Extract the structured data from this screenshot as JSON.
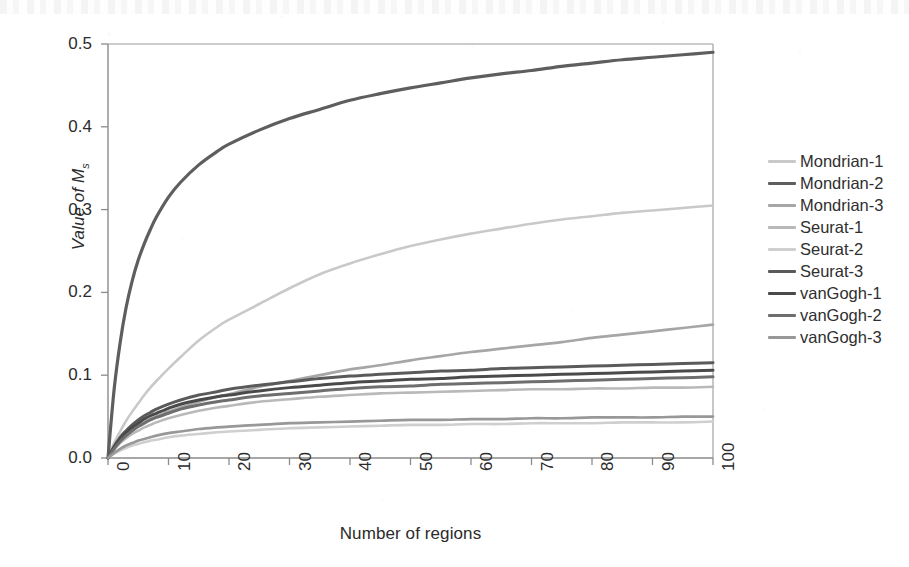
{
  "chart_data": {
    "type": "line",
    "title": "",
    "xlabel": "Number of regions",
    "ylabel": "Value of Ms",
    "ylabel_base": "Value of M",
    "ylabel_sub": "s",
    "xlim": [
      0,
      100
    ],
    "ylim": [
      0.0,
      0.5
    ],
    "grid": false,
    "legend_position": "right",
    "x_ticks": [
      "0",
      "10",
      "20",
      "30",
      "40",
      "50",
      "60",
      "70",
      "80",
      "90",
      "100"
    ],
    "x_tick_values": [
      0,
      10,
      20,
      30,
      40,
      50,
      60,
      70,
      80,
      90,
      100
    ],
    "y_ticks": [
      "0.0",
      "0.1",
      "0.2",
      "0.3",
      "0.4",
      "0.5"
    ],
    "y_tick_values": [
      0.0,
      0.1,
      0.2,
      0.3,
      0.4,
      0.5
    ],
    "x": [
      0,
      1,
      2,
      3,
      4,
      5,
      6,
      7,
      8,
      10,
      12,
      15,
      18,
      20,
      25,
      30,
      35,
      40,
      45,
      50,
      55,
      60,
      65,
      70,
      75,
      80,
      85,
      90,
      95,
      100
    ],
    "series": [
      {
        "name": "Mondrian-1",
        "color": "#c9c9c9",
        "width": 2.6,
        "values": [
          0.0,
          0.018,
          0.032,
          0.045,
          0.056,
          0.066,
          0.076,
          0.085,
          0.093,
          0.108,
          0.122,
          0.142,
          0.158,
          0.167,
          0.186,
          0.205,
          0.222,
          0.235,
          0.246,
          0.256,
          0.264,
          0.271,
          0.277,
          0.283,
          0.288,
          0.292,
          0.296,
          0.299,
          0.302,
          0.305
        ]
      },
      {
        "name": "Mondrian-2",
        "color": "#5e5e5e",
        "width": 3.2,
        "values": [
          0.0,
          0.082,
          0.139,
          0.182,
          0.214,
          0.239,
          0.259,
          0.276,
          0.291,
          0.315,
          0.333,
          0.354,
          0.37,
          0.379,
          0.396,
          0.41,
          0.421,
          0.432,
          0.44,
          0.447,
          0.453,
          0.459,
          0.464,
          0.468,
          0.473,
          0.477,
          0.481,
          0.484,
          0.487,
          0.49
        ]
      },
      {
        "name": "Mondrian-3",
        "color": "#a6a6a6",
        "width": 2.7,
        "values": [
          0.0,
          0.012,
          0.021,
          0.028,
          0.034,
          0.039,
          0.043,
          0.047,
          0.05,
          0.056,
          0.061,
          0.068,
          0.074,
          0.077,
          0.086,
          0.093,
          0.1,
          0.107,
          0.112,
          0.118,
          0.123,
          0.128,
          0.132,
          0.136,
          0.14,
          0.145,
          0.149,
          0.153,
          0.157,
          0.161
        ]
      },
      {
        "name": "Seurat-1",
        "color": "#b9b9b9",
        "width": 2.6,
        "values": [
          0.0,
          0.01,
          0.018,
          0.024,
          0.029,
          0.033,
          0.037,
          0.04,
          0.043,
          0.048,
          0.052,
          0.057,
          0.061,
          0.063,
          0.068,
          0.071,
          0.074,
          0.076,
          0.078,
          0.079,
          0.08,
          0.081,
          0.082,
          0.083,
          0.083,
          0.084,
          0.084,
          0.085,
          0.085,
          0.086
        ]
      },
      {
        "name": "Seurat-2",
        "color": "#cfcfcf",
        "width": 2.6,
        "values": [
          0.0,
          0.005,
          0.009,
          0.012,
          0.015,
          0.017,
          0.019,
          0.021,
          0.022,
          0.025,
          0.027,
          0.029,
          0.031,
          0.032,
          0.034,
          0.036,
          0.037,
          0.038,
          0.039,
          0.04,
          0.04,
          0.041,
          0.041,
          0.042,
          0.042,
          0.042,
          0.043,
          0.043,
          0.043,
          0.044
        ]
      },
      {
        "name": "Seurat-3",
        "color": "#5a5a5a",
        "width": 3.0,
        "values": [
          0.0,
          0.014,
          0.025,
          0.033,
          0.04,
          0.046,
          0.051,
          0.055,
          0.059,
          0.065,
          0.07,
          0.076,
          0.08,
          0.083,
          0.088,
          0.092,
          0.096,
          0.099,
          0.101,
          0.103,
          0.105,
          0.106,
          0.108,
          0.109,
          0.11,
          0.111,
          0.112,
          0.113,
          0.114,
          0.115
        ]
      },
      {
        "name": "vanGogh-1",
        "color": "#4a4a4a",
        "width": 3.0,
        "values": [
          0.0,
          0.013,
          0.023,
          0.031,
          0.037,
          0.042,
          0.047,
          0.051,
          0.054,
          0.06,
          0.065,
          0.07,
          0.074,
          0.076,
          0.081,
          0.085,
          0.088,
          0.091,
          0.093,
          0.095,
          0.096,
          0.098,
          0.099,
          0.1,
          0.101,
          0.102,
          0.103,
          0.104,
          0.105,
          0.106
        ]
      },
      {
        "name": "vanGogh-2",
        "color": "#6e6e6e",
        "width": 3.0,
        "values": [
          0.0,
          0.011,
          0.02,
          0.027,
          0.033,
          0.038,
          0.042,
          0.046,
          0.049,
          0.054,
          0.059,
          0.064,
          0.068,
          0.07,
          0.075,
          0.078,
          0.081,
          0.084,
          0.086,
          0.087,
          0.089,
          0.09,
          0.091,
          0.092,
          0.093,
          0.094,
          0.095,
          0.096,
          0.097,
          0.098
        ]
      },
      {
        "name": "vanGogh-3",
        "color": "#989898",
        "width": 2.7,
        "values": [
          0.0,
          0.006,
          0.011,
          0.015,
          0.018,
          0.021,
          0.023,
          0.025,
          0.027,
          0.03,
          0.032,
          0.035,
          0.037,
          0.038,
          0.04,
          0.042,
          0.043,
          0.044,
          0.045,
          0.046,
          0.046,
          0.047,
          0.047,
          0.048,
          0.048,
          0.049,
          0.049,
          0.049,
          0.05,
          0.05
        ]
      }
    ]
  },
  "axis": {
    "frame_color": "#8c8c8c",
    "tick_color": "#8c8c8c"
  }
}
